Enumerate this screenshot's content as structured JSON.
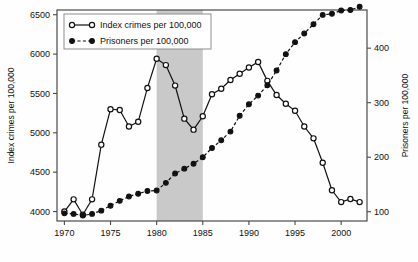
{
  "chart_data": {
    "type": "line",
    "title": "",
    "xlabel": "",
    "ylabel": "Index crimes per 100,000",
    "y2label": "Prisoners per 100,000",
    "xlim": [
      1969.2,
      2002.8
    ],
    "ylim": [
      3880,
      6560
    ],
    "y2lim": [
      83,
      470
    ],
    "grid": false,
    "legend_position": "top-left",
    "xticks": [
      1970,
      1975,
      1980,
      1985,
      1990,
      1995,
      2000
    ],
    "xtick_labels": [
      "1970",
      "1975",
      "1980",
      "1985",
      "1990",
      "1995",
      "2000"
    ],
    "yticks": [
      4000,
      4500,
      5000,
      5500,
      6000,
      6500
    ],
    "ytick_labels": [
      "4000",
      "4500",
      "5000",
      "5500",
      "6000",
      "6500"
    ],
    "y2ticks": [
      100,
      200,
      300,
      400
    ],
    "y2tick_labels": [
      "100",
      "200",
      "300",
      "400"
    ],
    "shaded_band": {
      "x_start": 1980,
      "x_end": 1985,
      "color": "#c9c9c9"
    },
    "x": [
      1970,
      1971,
      1972,
      1973,
      1974,
      1975,
      1976,
      1977,
      1978,
      1979,
      1980,
      1981,
      1982,
      1983,
      1984,
      1985,
      1986,
      1987,
      1988,
      1989,
      1990,
      1991,
      1992,
      1993,
      1994,
      1995,
      1996,
      1997,
      1998,
      1999,
      2000,
      2001,
      2002
    ],
    "series": [
      {
        "name": "Index crimes per 100,000",
        "axis": "left",
        "marker": "open-circle",
        "line_style": "solid",
        "color": "#111111",
        "values": [
          4000,
          4155,
          3960,
          4155,
          4850,
          5300,
          5290,
          5080,
          5140,
          5570,
          5940,
          5860,
          5600,
          5180,
          5040,
          5210,
          5490,
          5560,
          5670,
          5750,
          5830,
          5900,
          5660,
          5480,
          5370,
          5280,
          5080,
          4930,
          4620,
          4270,
          4120,
          4160,
          4120
        ]
      },
      {
        "name": "Prisoners per 100,000",
        "axis": "right",
        "marker": "filled-circle",
        "line_style": "dashed",
        "color": "#111111",
        "values": [
          97,
          96,
          93,
          96,
          102,
          111,
          120,
          128,
          133,
          138,
          139,
          153,
          170,
          179,
          188,
          200,
          217,
          231,
          247,
          276,
          297,
          313,
          332,
          359,
          389,
          411,
          427,
          444,
          461,
          463,
          469,
          470,
          476
        ]
      }
    ]
  }
}
